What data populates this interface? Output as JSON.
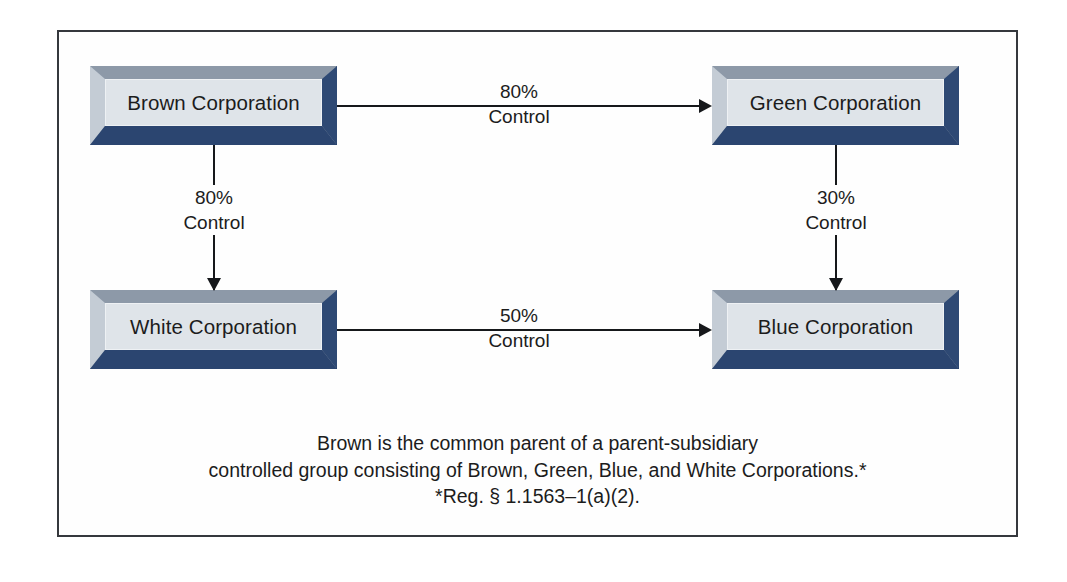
{
  "diagram": {
    "type": "flowchart",
    "nodes": [
      {
        "id": "brown",
        "label": "Brown Corporation"
      },
      {
        "id": "green",
        "label": "Green Corporation"
      },
      {
        "id": "white",
        "label": "White Corporation"
      },
      {
        "id": "blue",
        "label": "Blue Corporation"
      }
    ],
    "edges": [
      {
        "id": "brown-green",
        "from": "brown",
        "to": "green",
        "percent": "80%",
        "relation": "Control",
        "direction": "right"
      },
      {
        "id": "brown-white",
        "from": "brown",
        "to": "white",
        "percent": "80%",
        "relation": "Control",
        "direction": "down"
      },
      {
        "id": "green-blue",
        "from": "green",
        "to": "blue",
        "percent": "30%",
        "relation": "Control",
        "direction": "down"
      },
      {
        "id": "white-blue",
        "from": "white",
        "to": "blue",
        "percent": "50%",
        "relation": "Control",
        "direction": "right"
      }
    ],
    "caption": {
      "line1": "Brown is the common parent of a parent-subsidiary",
      "line2": "controlled group consisting of Brown, Green, Blue, and White Corporations.*",
      "line3": "*Reg. § 1.1563–1(a)(2)."
    },
    "colors": {
      "box_face": "#dfe4e9",
      "bevel_top": "#8d99a8",
      "bevel_left": "#c4ccd5",
      "bevel_bottom": "#2b4570",
      "bevel_right": "#2e4974",
      "line": "#16181b",
      "frame": "#35383d",
      "text": "#1c1c1c",
      "background": "#ffffff"
    }
  }
}
